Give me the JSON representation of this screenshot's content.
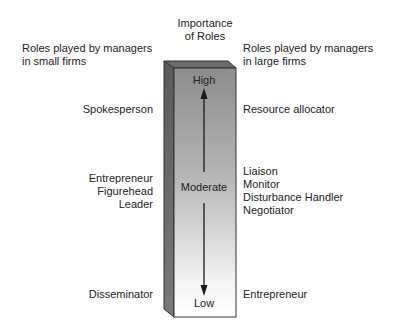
{
  "diagram": {
    "title_line1": "Importance",
    "title_line2": "of Roles",
    "left_header_line1": "Roles played by managers",
    "left_header_line2": "in small firms",
    "right_header_line1": "Roles played by managers",
    "right_header_line2": "in large firms",
    "scale": {
      "high": "High",
      "moderate": "Moderate",
      "low": "Low"
    },
    "small_firms": {
      "high": [
        "Spokesperson"
      ],
      "moderate": [
        "Entrepreneur",
        "Figurehead",
        "Leader"
      ],
      "low": [
        "Disseminator"
      ]
    },
    "large_firms": {
      "high": [
        "Resource allocator"
      ],
      "moderate": [
        "Liaison",
        "Monitor",
        "Disturbance Handler",
        "Negotiator"
      ],
      "low": [
        "Entrepreneur"
      ]
    },
    "colors": {
      "bar_top": "#8c8c8c",
      "bar_bottom": "#ffffff",
      "side_face": "#5e5e5e",
      "top_face": "#6b6b6b",
      "arrow": "#1a1a1a"
    }
  }
}
